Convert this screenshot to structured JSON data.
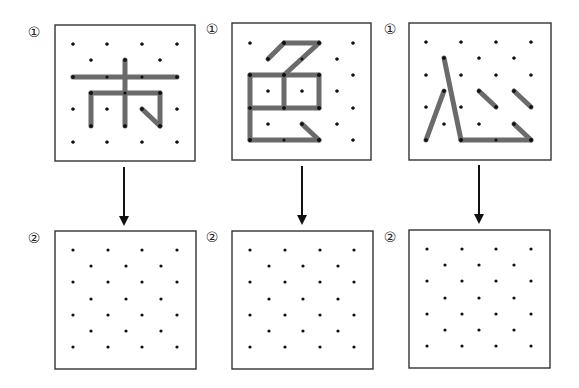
{
  "colors": {
    "stroke": "#6b6b6b",
    "dot": "#111111",
    "box_border": "#333333",
    "arrow": "#111111"
  },
  "grid": {
    "rows": 7,
    "pattern": "staggered: rows 0,2,4,6 have 4 dots; rows 1,3,5 have 3 dots offset by half spacing"
  },
  "panels": [
    {
      "id": "panel-1",
      "character": "市",
      "step_top_label": "①",
      "step_bottom_label": "②",
      "top_box": {
        "x": 55,
        "y": 25,
        "w": 140,
        "h": 136
      },
      "bottom_box": {
        "x": 55,
        "y": 231,
        "w": 141,
        "h": 138
      },
      "top_grid": {
        "x4": [
          73,
          107,
          142,
          177
        ],
        "x3": [
          91,
          125,
          160
        ],
        "y": [
          44,
          60,
          77,
          93,
          109,
          126,
          142
        ]
      },
      "bottom_grid": {
        "x4": [
          73,
          108,
          142,
          177
        ],
        "x3": [
          91,
          126,
          161
        ],
        "y": [
          250,
          266,
          282,
          299,
          315,
          331,
          347
        ]
      },
      "arrow": {
        "x": 124,
        "y1": 167,
        "y2": 226
      },
      "label_top_pos": {
        "x": 26,
        "y": 25
      },
      "label_bottom_pos": {
        "x": 26,
        "y": 231
      },
      "strokes": [
        [
          [
            125,
            60
          ],
          [
            125,
            126
          ]
        ],
        [
          [
            73,
            77
          ],
          [
            177,
            77
          ]
        ],
        [
          [
            91,
            93
          ],
          [
            160,
            93
          ]
        ],
        [
          [
            91,
            93
          ],
          [
            91,
            126
          ]
        ],
        [
          [
            160,
            93
          ],
          [
            160,
            126
          ]
        ],
        [
          [
            142,
            109
          ],
          [
            160,
            126
          ]
        ]
      ]
    },
    {
      "id": "panel-2",
      "character": "色",
      "step_top_label": "①",
      "step_bottom_label": "②",
      "top_box": {
        "x": 232,
        "y": 23,
        "w": 139,
        "h": 137
      },
      "bottom_box": {
        "x": 232,
        "y": 231,
        "w": 141,
        "h": 138
      },
      "top_grid": {
        "x4": [
          250,
          284,
          319,
          353
        ],
        "x3": [
          268,
          302,
          337
        ],
        "y": [
          43,
          59,
          75,
          91,
          108,
          124,
          140
        ]
      },
      "bottom_grid": {
        "x4": [
          250,
          285,
          320,
          354
        ],
        "x3": [
          269,
          303,
          338
        ],
        "y": [
          250,
          266,
          282,
          299,
          315,
          331,
          347
        ]
      },
      "arrow": {
        "x": 302,
        "y1": 166,
        "y2": 225
      },
      "label_top_pos": {
        "x": 204,
        "y": 22
      },
      "label_bottom_pos": {
        "x": 204,
        "y": 230
      },
      "strokes": [
        [
          [
            268,
            59
          ],
          [
            284,
            43
          ]
        ],
        [
          [
            284,
            43
          ],
          [
            319,
            43
          ]
        ],
        [
          [
            319,
            43
          ],
          [
            284,
            75
          ]
        ],
        [
          [
            250,
            75
          ],
          [
            319,
            75
          ]
        ],
        [
          [
            250,
            108
          ],
          [
            319,
            108
          ]
        ],
        [
          [
            250,
            75
          ],
          [
            250,
            140
          ]
        ],
        [
          [
            284,
            75
          ],
          [
            284,
            108
          ]
        ],
        [
          [
            319,
            75
          ],
          [
            319,
            108
          ]
        ],
        [
          [
            250,
            140
          ],
          [
            319,
            140
          ]
        ],
        [
          [
            302,
            124
          ],
          [
            319,
            140
          ]
        ]
      ]
    },
    {
      "id": "panel-3",
      "character": "心",
      "step_top_label": "①",
      "step_bottom_label": "②",
      "top_box": {
        "x": 409,
        "y": 23,
        "w": 142,
        "h": 137
      },
      "bottom_box": {
        "x": 409,
        "y": 230,
        "w": 141,
        "h": 138
      },
      "top_grid": {
        "x4": [
          426,
          461,
          496,
          531
        ],
        "x3": [
          444,
          479,
          514
        ],
        "y": [
          42,
          58,
          75,
          91,
          107,
          124,
          140
        ]
      },
      "bottom_grid": {
        "x4": [
          427,
          462,
          496,
          531
        ],
        "x3": [
          445,
          479,
          514
        ],
        "y": [
          249,
          265,
          281,
          298,
          314,
          330,
          346
        ]
      },
      "arrow": {
        "x": 479,
        "y1": 165,
        "y2": 224
      },
      "label_top_pos": {
        "x": 382,
        "y": 22
      },
      "label_bottom_pos": {
        "x": 382,
        "y": 230
      },
      "strokes": [
        [
          [
            444,
            58
          ],
          [
            461,
            140
          ]
        ],
        [
          [
            444,
            91
          ],
          [
            426,
            140
          ]
        ],
        [
          [
            479,
            91
          ],
          [
            496,
            107
          ]
        ],
        [
          [
            514,
            91
          ],
          [
            531,
            107
          ]
        ],
        [
          [
            461,
            140
          ],
          [
            531,
            140
          ]
        ],
        [
          [
            514,
            124
          ],
          [
            531,
            140
          ]
        ]
      ]
    }
  ]
}
